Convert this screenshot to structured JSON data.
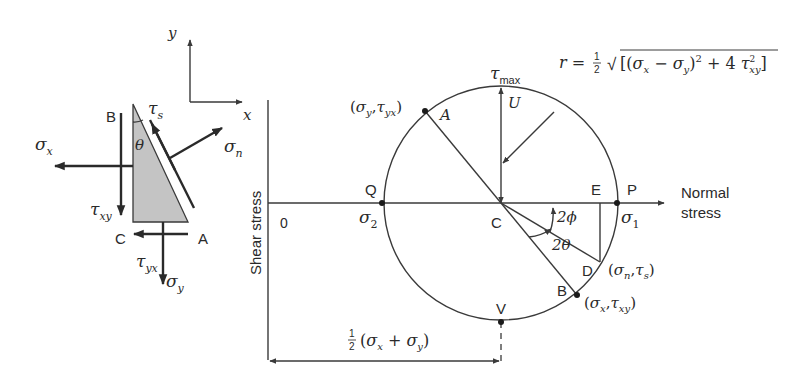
{
  "element": {
    "axes": {
      "x_label": "x",
      "y_label": "y"
    },
    "corners": {
      "B": "B",
      "C": "C",
      "A": "A"
    },
    "angle_label": "θ",
    "stresses": {
      "sigma_x": {
        "sym": "σ",
        "sub": "x"
      },
      "tau_xy": {
        "sym": "τ",
        "sub": "xy"
      },
      "tau_yx": {
        "sym": "τ",
        "sub": "yx"
      },
      "sigma_y": {
        "sym": "σ",
        "sub": "y"
      },
      "sigma_n": {
        "sym": "σ",
        "sub": "n"
      },
      "tau_s": {
        "sym": "τ",
        "sub": "s"
      }
    },
    "fill_color": "#c4c4c4"
  },
  "mohr": {
    "y_axis_label": "Shear stress",
    "x_axis_label_line1": "Normal",
    "x_axis_label_line2": "stress",
    "origin_label": "0",
    "center_label": "C",
    "points": {
      "Q": "Q",
      "P": "P",
      "E": "E",
      "D": "D",
      "A": "A",
      "B": "B",
      "U": "U",
      "V": "V"
    },
    "sigma_2": {
      "sym": "σ",
      "sub": "2"
    },
    "sigma_1": {
      "sym": "σ",
      "sub": "1"
    },
    "tau_max": {
      "sym": "τ",
      "sub": "max"
    },
    "point_A_coords": {
      "open": "(",
      "s": "σ",
      "s_sub": "y",
      "sep": ",",
      "t": "τ",
      "t_sub": "yx",
      "close": ")"
    },
    "point_B_coords": {
      "open": "(",
      "s": "σ",
      "s_sub": "x",
      "sep": ",",
      "t": "τ",
      "t_sub": "xy",
      "close": ")"
    },
    "point_D_coords": {
      "open": "(",
      "s": "σ",
      "s_sub": "n",
      "sep": ",",
      "t": "τ",
      "t_sub": "s",
      "close": ")"
    },
    "angle_2phi": "2ϕ",
    "angle_2theta": "2θ",
    "radius_formula": {
      "lhs": "r =",
      "half_num": "1",
      "half_den": "2",
      "root": "√",
      "open": "[(",
      "s1": "σ",
      "s1_sub": "x",
      "minus": " − ",
      "s2": "σ",
      "s2_sub": "y",
      "close_sq": ")",
      "sq": "2",
      "plus": " + 4 ",
      "t": "τ",
      "t_sup": "2",
      "t_sub": "xy",
      "close": "]"
    },
    "center_dimension": {
      "half_num": "1",
      "half_den": "2",
      "open": "(",
      "s1": "σ",
      "s1_sub": "x",
      "plus": " + ",
      "s2": "σ",
      "s2_sub": "y",
      "close": ")"
    },
    "geometry": {
      "center": [
        501,
        203
      ],
      "radius": 117
    }
  }
}
